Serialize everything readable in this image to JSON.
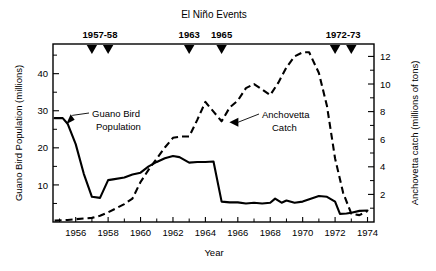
{
  "chart_data": {
    "type": "line",
    "title": "El Niño Events",
    "xlabel": "Year",
    "ylabel": "Guano Bird Population (millions)",
    "ylabel_right": "Anchovetta catch (millions of tons)",
    "xlim": [
      1954.6,
      1974.4
    ],
    "ylim": [
      0,
      48
    ],
    "ylim_right": [
      0,
      12.9
    ],
    "grid": false,
    "legend": "annotations-inline",
    "xticks": [
      1956,
      1958,
      1960,
      1962,
      1964,
      1966,
      1968,
      1970,
      1972,
      1974
    ],
    "xticklabels": [
      "1956",
      "1958",
      "1960",
      "1962",
      "1964",
      "1966",
      "1968",
      "1970",
      "1972",
      "1974"
    ],
    "xticks_minor": [
      1955,
      1957,
      1959,
      1961,
      1963,
      1965,
      1967,
      1969,
      1971,
      1973
    ],
    "yticks_left": [
      10,
      20,
      30,
      40
    ],
    "yticklabels_left": [
      "10",
      "20",
      "30",
      "40"
    ],
    "yticks_left_minor": [
      5,
      15,
      25,
      35,
      45
    ],
    "yticks_right": [
      2,
      4,
      6,
      8,
      10,
      12
    ],
    "yticklabels_right": [
      "2",
      "4",
      "6",
      "8",
      "10",
      "12"
    ],
    "yticks_right_minor": [
      1,
      3,
      5,
      7,
      9,
      11
    ],
    "series": [
      {
        "name": "Guano Bird Population",
        "axis": "left",
        "style": "solid",
        "units": "millions",
        "x": [
          1954.7,
          1955.2,
          1955.5,
          1956.0,
          1956.5,
          1957.0,
          1957.5,
          1958.0,
          1958.3,
          1959.0,
          1959.5,
          1960.0,
          1960.5,
          1961.0,
          1961.5,
          1962.0,
          1962.4,
          1963.0,
          1963.5,
          1964.0,
          1964.5,
          1965.0,
          1965.5,
          1966.0,
          1966.5,
          1967.0,
          1967.5,
          1968.0,
          1968.3,
          1968.7,
          1969.0,
          1969.5,
          1970.0,
          1970.5,
          1971.0,
          1971.5,
          1972.0,
          1972.3,
          1972.7,
          1973.0,
          1973.5,
          1974.0
        ],
        "y": [
          28.0,
          28.0,
          26.5,
          21.0,
          13.0,
          6.8,
          6.5,
          11.3,
          11.5,
          12.0,
          12.8,
          13.3,
          15.0,
          16.2,
          17.2,
          17.8,
          17.5,
          16.0,
          16.2,
          16.2,
          16.3,
          5.5,
          5.3,
          5.3,
          5.0,
          5.2,
          5.0,
          5.2,
          6.3,
          5.2,
          5.8,
          5.2,
          5.5,
          6.3,
          7.0,
          6.8,
          5.5,
          2.2,
          2.3,
          2.5,
          3.0,
          3.1
        ]
      },
      {
        "name": "Anchovetta Catch",
        "axis": "right",
        "style": "dashed",
        "units": "millions of tons",
        "x": [
          1954.7,
          1955.5,
          1956.0,
          1956.5,
          1957.0,
          1957.5,
          1958.0,
          1958.5,
          1959.0,
          1959.5,
          1960.0,
          1960.5,
          1961.0,
          1961.5,
          1962.0,
          1962.5,
          1963.0,
          1963.5,
          1964.0,
          1964.5,
          1965.0,
          1965.5,
          1966.0,
          1966.5,
          1967.0,
          1967.5,
          1968.0,
          1968.5,
          1969.0,
          1969.5,
          1970.0,
          1970.4,
          1971.0,
          1971.5,
          1972.0,
          1972.5,
          1973.0,
          1973.5,
          1974.0
        ],
        "y": [
          0.1,
          0.15,
          0.2,
          0.25,
          0.3,
          0.45,
          0.7,
          1.0,
          1.3,
          1.7,
          2.9,
          3.8,
          4.6,
          5.4,
          6.1,
          6.2,
          6.2,
          7.4,
          8.7,
          8.0,
          7.3,
          8.3,
          8.8,
          9.7,
          10.0,
          9.6,
          9.2,
          10.1,
          11.2,
          12.0,
          12.3,
          12.3,
          10.8,
          8.4,
          4.6,
          2.1,
          0.6,
          0.5,
          0.8
        ]
      }
    ],
    "annotations": [
      {
        "name": "guano-bird-population",
        "text_line1": "Guano Bird",
        "text_line2": "Population",
        "points_to_x": 1955.35,
        "points_to_y_left": 26.6
      },
      {
        "name": "anchovetta-catch",
        "text_line1": "Anchovetta",
        "text_line2": "Catch",
        "points_to_x": 1965.45,
        "points_to_y_right": 7.3
      }
    ],
    "event_markers": {
      "title": "El Niño Events",
      "groups": [
        {
          "label": "1957-58",
          "years": [
            1957.0,
            1958.0
          ]
        },
        {
          "label": "1963",
          "years": [
            1963.0
          ]
        },
        {
          "label": "1965",
          "years": [
            1965.0
          ]
        },
        {
          "label": "1972-73",
          "years": [
            1972.0,
            1973.0
          ]
        }
      ]
    }
  }
}
